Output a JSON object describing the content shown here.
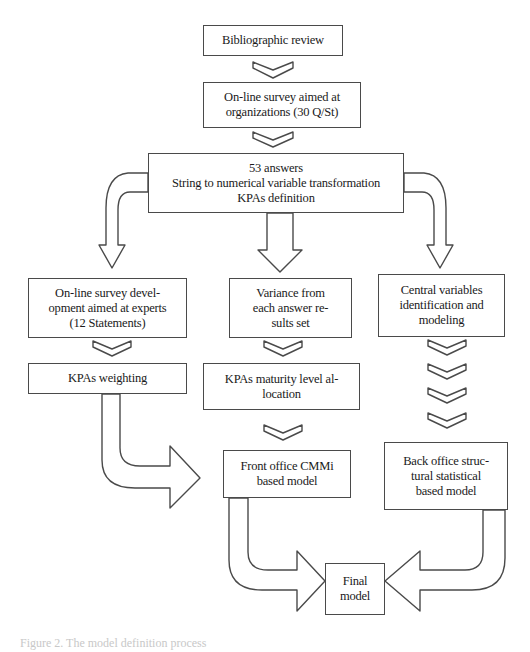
{
  "diagram": {
    "type": "flowchart",
    "nodes": {
      "bibliographic_review": "Bibliographic review",
      "online_survey_orgs": "On-line survey aimed at\norganizations (30 Q/St)",
      "answers_processing": "53 answers\nString to numerical variable transformation\nKPAs definition",
      "online_survey_experts": "On-line survey devel-\nopment aimed at experts\n(12 Statements)",
      "variance": "Variance from\neach answer re-\nsults set",
      "central_variables": "Central variables\nidentification and\nmodeling",
      "kpas_weighting": "KPAs weighting",
      "kpas_maturity": "KPAs maturity level al-\nlocation",
      "front_office_model": "Front office CMMi\nbased model",
      "back_office_model": "Back office struc-\ntural statistical\nbased model",
      "final_model": "Final\nmodel"
    },
    "edges": [
      [
        "bibliographic_review",
        "online_survey_orgs"
      ],
      [
        "online_survey_orgs",
        "answers_processing"
      ],
      [
        "answers_processing",
        "online_survey_experts"
      ],
      [
        "answers_processing",
        "variance"
      ],
      [
        "answers_processing",
        "central_variables"
      ],
      [
        "online_survey_experts",
        "kpas_weighting"
      ],
      [
        "variance",
        "kpas_maturity"
      ],
      [
        "central_variables",
        "back_office_model"
      ],
      [
        "kpas_weighting",
        "front_office_model"
      ],
      [
        "kpas_maturity",
        "front_office_model"
      ],
      [
        "front_office_model",
        "final_model"
      ],
      [
        "back_office_model",
        "final_model"
      ]
    ],
    "caption": "Figure 2.   The model definition process"
  },
  "colors": {
    "stroke": "#4a4a4a",
    "background": "#ffffff",
    "text": "#1a1a1a"
  }
}
